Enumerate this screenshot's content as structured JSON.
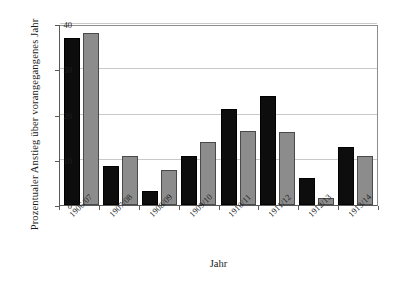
{
  "chart_data": {
    "type": "bar",
    "title": "",
    "xlabel": "Jahr",
    "ylabel": "Prozentualer Anstieg  über vorangegangenes  Jahr",
    "categories": [
      "1906/07",
      "1907/08",
      "1908/09",
      "1909/10",
      "1910/11",
      "1911/12",
      "1912/13",
      "1913/14"
    ],
    "series": [
      {
        "name": "series-1",
        "color": "#0d0d0d",
        "values": [
          37.0,
          8.6,
          3.1,
          10.8,
          21.2,
          24.0,
          6.0,
          12.8
        ]
      },
      {
        "name": "series-2",
        "color": "#8c8c8c",
        "values": [
          38.0,
          10.9,
          7.8,
          14.0,
          16.3,
          16.1,
          1.5,
          10.8
        ]
      }
    ],
    "ylim": [
      0,
      40
    ],
    "yticks": [
      0,
      10,
      20,
      30,
      40
    ],
    "ytick_labels": [
      "0",
      "10",
      "20",
      "30",
      "40"
    ],
    "grid": true,
    "grid_axis": "y",
    "legend": false,
    "legend_position": "none"
  }
}
